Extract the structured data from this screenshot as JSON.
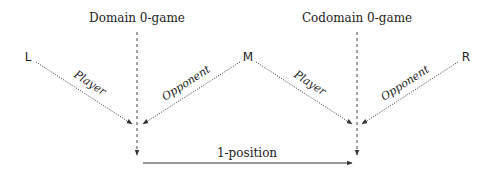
{
  "diagram": {
    "titles": {
      "domain": "Domain 0-game",
      "codomain": "Codomain 0-game"
    },
    "nodes": {
      "left": "L",
      "middle": "M",
      "right": "R"
    },
    "edge_labels": {
      "left_player": "Player",
      "middle_opponent": "Opponent",
      "middle_player": "Player",
      "right_opponent": "Opponent",
      "bottom": "1-position"
    },
    "colors": {
      "line": "#333333",
      "text": "#222222"
    }
  }
}
